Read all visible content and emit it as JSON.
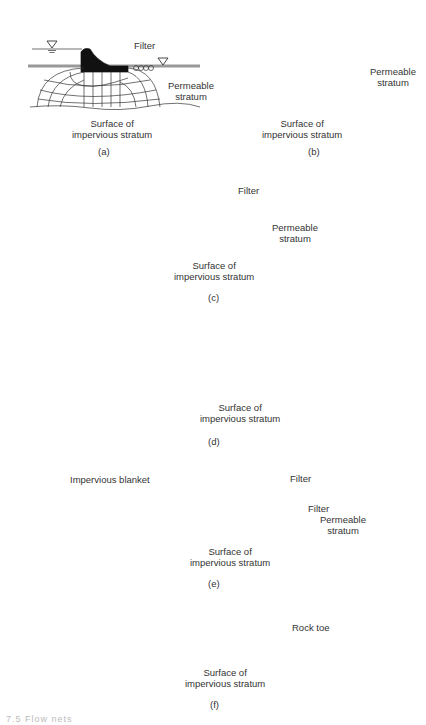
{
  "panels": [
    {
      "id": "a",
      "caption": "(a)",
      "labels": {
        "filter": "Filter",
        "permeable": "Permeable\nstratum",
        "impervious": "Surface of\nimpervious stratum"
      }
    },
    {
      "id": "b",
      "caption": "(b)",
      "labels": {
        "permeable": "Permeable\nstratum",
        "impervious": "Surface of\nimpervious stratum"
      }
    },
    {
      "id": "c",
      "caption": "(c)",
      "labels": {
        "filter": "Filter",
        "permeable": "Permeable\nstratum",
        "impervious": "Surface of\nimpervious stratum"
      }
    },
    {
      "id": "d",
      "caption": "(d)",
      "labels": {
        "impervious": "Surface of\nimpervious stratum"
      }
    },
    {
      "id": "e",
      "caption": "(e)",
      "labels": {
        "blanket": "Impervious blanket",
        "filter_top": "Filter",
        "filter_lower": "Filter",
        "permeable": "Permeable\nstratum",
        "impervious": "Surface of\nimpervious stratum"
      }
    },
    {
      "id": "f",
      "caption": "(f)",
      "labels": {
        "rock_toe": "Rock toe",
        "impervious": "Surface of\nimpervious stratum"
      }
    }
  ],
  "figure_caption": "7.5  Flow nets"
}
